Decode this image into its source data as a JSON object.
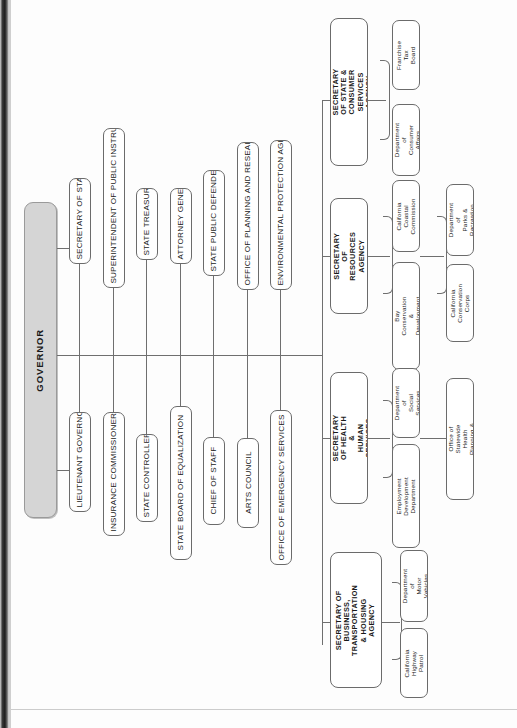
{
  "chart_title": "State of California Executive Branch Organization Chart",
  "orientation": "rotated-90",
  "root": {
    "label": "GOVERNOR"
  },
  "officers": [
    {
      "label": "SECRETARY OF STATE"
    },
    {
      "label": "SUPERINTENDENT OF PUBLIC INSTRUCTION"
    },
    {
      "label": "STATE TREASURER"
    },
    {
      "label": "ATTORNEY GENERAL"
    },
    {
      "label": "STATE PUBLIC DEFENDER"
    },
    {
      "label": "OFFICE OF PLANNING AND RESEARCH"
    },
    {
      "label": "ENVIRONMENTAL PROTECTION AGENCY"
    },
    {
      "label": "LIEUTENANT GOVERNOR"
    },
    {
      "label": "INSURANCE COMMISSIONER"
    },
    {
      "label": "STATE CONTROLLER"
    },
    {
      "label": "STATE BOARD OF EQUALIZATION"
    },
    {
      "label": "CHIEF OF STAFF"
    },
    {
      "label": "ARTS COUNCIL"
    },
    {
      "label": "OFFICE OF EMERGENCY SERVICES"
    }
  ],
  "agencies": [
    {
      "label": "SECRETARY OF STATE &\nCONSUMER SERVICES AGENCY",
      "departments": [
        {
          "label": "Franchise\nTax Board"
        },
        {
          "label": "Department of\nConsumer Affairs"
        }
      ]
    },
    {
      "label": "SECRETARY OF\nRESOURCES AGENCY",
      "departments": [
        {
          "label": "California Coastal\nCommission"
        },
        {
          "label": "Bay Conservation &\nDevelopment Commission"
        },
        {
          "label": "Department of\nParks & Recreation"
        },
        {
          "label": "California\nConservation Corps"
        }
      ]
    },
    {
      "label": "SECRETARY OF HEALTH &\nHUMAN SERVICES  AGENCY",
      "departments": [
        {
          "label": "Department of\nSocial Services"
        },
        {
          "label": "Employment\nDevelopment Department"
        },
        {
          "label": "Office of Statewide\nHealth Planning & Development"
        }
      ]
    },
    {
      "label": "SECRETARY OF BUSINESS,\nTRANSPORTATION & HOUSING\nAGENCY",
      "departments": [
        {
          "label": "Department of\nMotor Vehicles"
        },
        {
          "label": "California\nHighway Patrol"
        }
      ]
    }
  ],
  "colors": {
    "root_fill": "#d5d5d5",
    "box_stroke": "#6b6b6b",
    "line": "#6f6f6f",
    "text": "#1a1a1a",
    "page": "#fdfdfd"
  }
}
